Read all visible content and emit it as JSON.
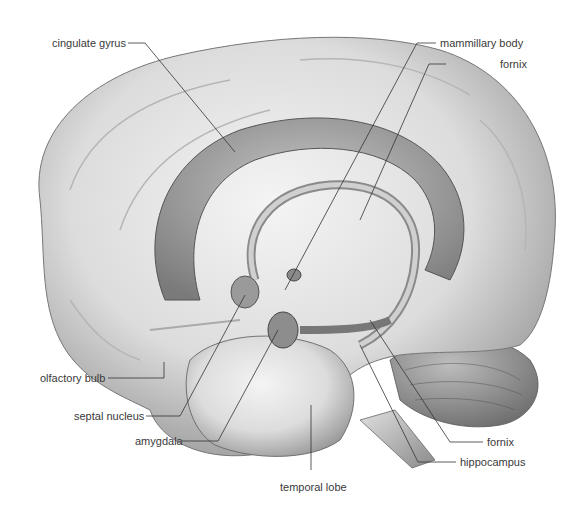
{
  "figure": {
    "labels": {
      "cingulate_gyrus": "cingulate gyrus",
      "mammillary_body": "mammillary body",
      "fornix_top": "fornix",
      "olfactory_bulb": "olfactory bulb",
      "septal_nucleus": "septal nucleus",
      "amygdala": "amygdala",
      "temporal_lobe": "temporal lobe",
      "fornix_bottom": "fornix",
      "hippocampus": "hippocampus"
    }
  }
}
